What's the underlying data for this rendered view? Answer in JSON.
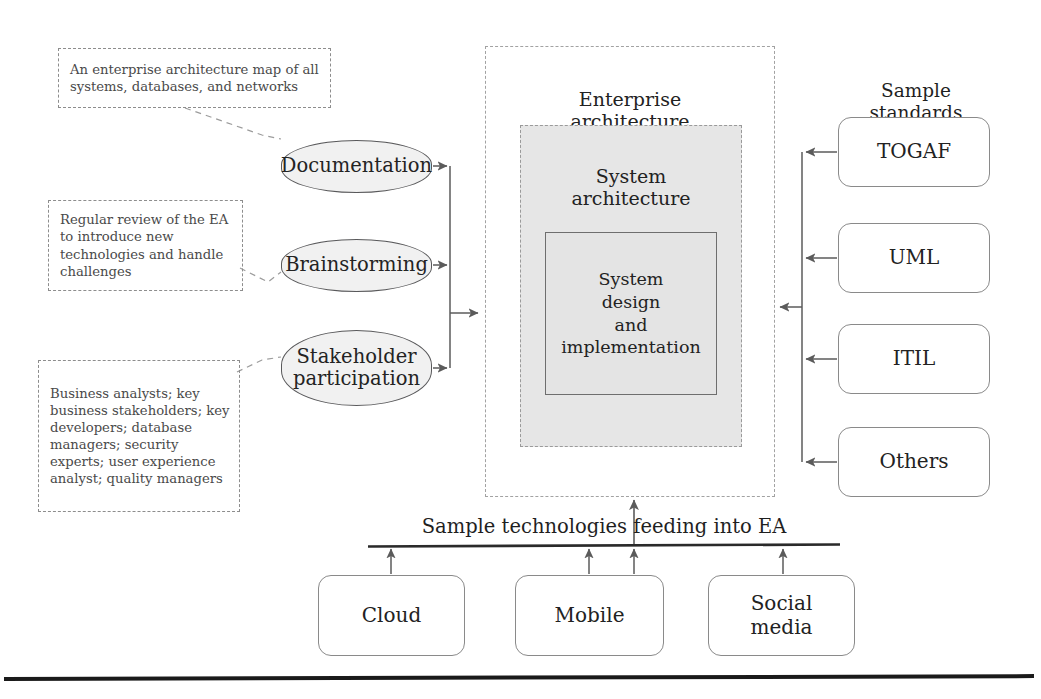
{
  "diagram": {
    "title": "Enterprise architecture map",
    "notes": [
      {
        "id": "documentation-note",
        "text": "An enterprise architecture map of all systems, databases, and networks"
      },
      {
        "id": "brainstorming-note",
        "text": "Regular review of the EA to introduce new technologies and handle challenges"
      },
      {
        "id": "stakeholder-note",
        "text": "Business analysts; key business stakeholders; key developers; database managers; security experts; user experience analyst; quality managers"
      }
    ],
    "activities": [
      {
        "id": "documentation",
        "label": "Documentation"
      },
      {
        "id": "brainstorming",
        "label": "Brainstorming"
      },
      {
        "id": "stakeholder-participation",
        "label": "Stakeholder\nparticipation"
      }
    ],
    "core": {
      "enterprise_architecture": "Enterprise\narchitecture",
      "system_architecture": "System\narchitecture",
      "system_design": "System\ndesign\nand\nimplementation"
    },
    "standards": {
      "caption": "Sample standards\nfeeding into EA",
      "items": [
        {
          "id": "togaf",
          "label": "TOGAF"
        },
        {
          "id": "uml",
          "label": "UML"
        },
        {
          "id": "itil",
          "label": "ITIL"
        },
        {
          "id": "others",
          "label": "Others"
        }
      ]
    },
    "technologies": {
      "caption": "Sample technologies feeding into EA",
      "items": [
        {
          "id": "cloud",
          "label": "Cloud"
        },
        {
          "id": "mobile",
          "label": "Mobile"
        },
        {
          "id": "social-media",
          "label": "Social\nmedia"
        }
      ]
    },
    "colors": {
      "page_background": "#ffffff",
      "activity_fill": "#f1f1f1",
      "activity_stroke": "#59595b",
      "system_architecture_fill": "#e6e6e6",
      "system_design_fill": "#e4e4e4",
      "dashed_stroke": "#9a9a9a",
      "plain_stroke": "#8a8a8a",
      "connector_stroke": "#5b5b5b",
      "text": "#222222",
      "note_text": "#4a4a4a",
      "page_rule": "#1a1a1a"
    }
  }
}
